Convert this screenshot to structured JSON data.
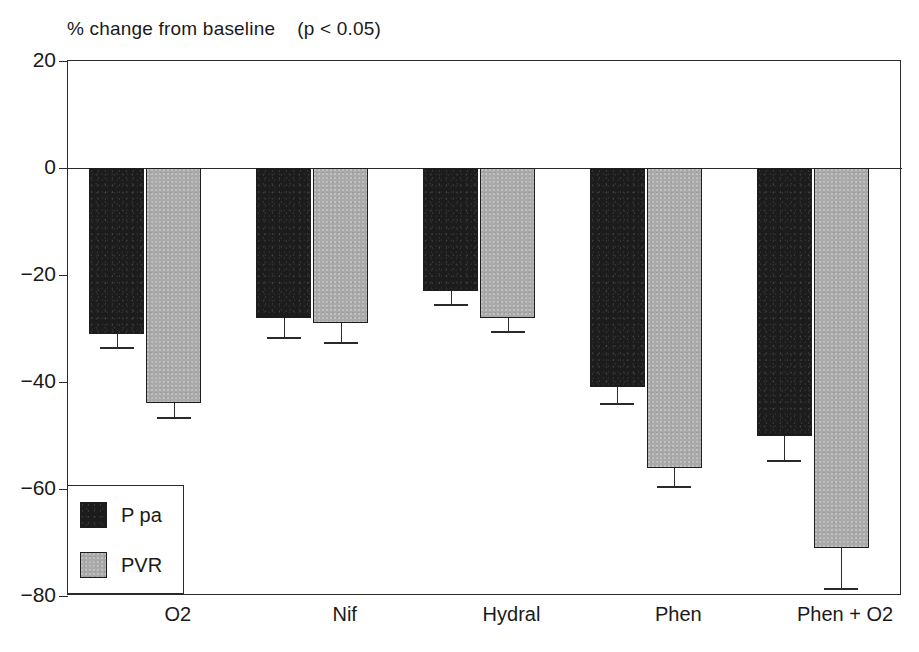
{
  "chart_data": {
    "type": "bar",
    "title": "% change from baseline    (p < 0.05)",
    "title_main": "% change from baseline",
    "title_note": "(p < 0.05)",
    "xlabel": "",
    "ylabel": "",
    "ylim": [
      -80,
      20
    ],
    "yticks": [
      20,
      0,
      -20,
      -40,
      -60,
      -80
    ],
    "ytick_labels": [
      "20",
      "0",
      "−20",
      "−40",
      "−60",
      "−80"
    ],
    "grid": false,
    "legend_position": "lower-left-inside",
    "categories": [
      "O2",
      "Nif",
      "Hydral",
      "Phen",
      "Phen + O2"
    ],
    "series": [
      {
        "name": "P pa",
        "color": "#1c1c1c",
        "values": [
          -31,
          -28,
          -23,
          -41,
          -50
        ],
        "errors": [
          2.5,
          3.5,
          2.5,
          3.0,
          4.5
        ]
      },
      {
        "name": "PVR",
        "color": "#a9a9a9",
        "values": [
          -44,
          -29,
          -28,
          -56,
          -71
        ],
        "errors": [
          2.5,
          3.5,
          2.5,
          3.5,
          7.5
        ]
      }
    ]
  },
  "legend": {
    "items": [
      {
        "label": "P pa",
        "swatch": "ppa"
      },
      {
        "label": "PVR",
        "swatch": "pvr"
      }
    ]
  },
  "axis": {
    "y_labels": [
      "20",
      "0",
      "−20",
      "−40",
      "−60",
      "−80"
    ],
    "x_labels": [
      "O2",
      "Nif",
      "Hydral",
      "Phen",
      "Phen + O2"
    ]
  },
  "colors": {
    "ppa": "#1c1c1c",
    "pvr": "#a9a9a9",
    "axis": "#2a2a2a",
    "background": "#ffffff",
    "text": "#1a1a1a"
  }
}
